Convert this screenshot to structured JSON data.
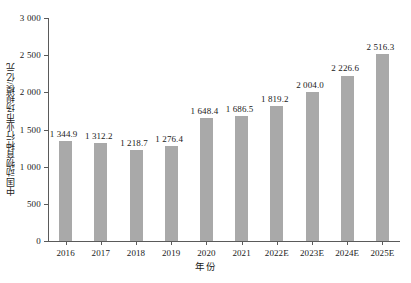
{
  "chart_data": {
    "type": "bar",
    "title": "",
    "xlabel": "年份",
    "ylabel": "中国动物育种行业市场规模/亿元",
    "categories": [
      "2016",
      "2017",
      "2018",
      "2019",
      "2020",
      "2021",
      "2022E",
      "2023E",
      "2024E",
      "2025E"
    ],
    "values": [
      1344.9,
      1312.2,
      1218.7,
      1276.4,
      1648.4,
      1686.5,
      1819.2,
      2004.0,
      2226.6,
      2516.3
    ],
    "value_labels": [
      "1 344.9",
      "1 312.2",
      "1 218.7",
      "1 276.4",
      "1 648.4",
      "1 686.5",
      "1 819.2",
      "2 004.0",
      "2 226.6",
      "2 516.3"
    ],
    "ylim": [
      0,
      3000
    ],
    "yticks": [
      0,
      500,
      1000,
      1500,
      2000,
      2500,
      3000
    ],
    "ytick_labels": [
      "0",
      "500",
      "1 000",
      "1 500",
      "2 000",
      "2 500",
      "3 000"
    ],
    "grid": false,
    "legend": "none",
    "bar_color": "#a9a9a9",
    "axis_color": "#5a5a5a",
    "text_color": "#1a1a1a"
  }
}
